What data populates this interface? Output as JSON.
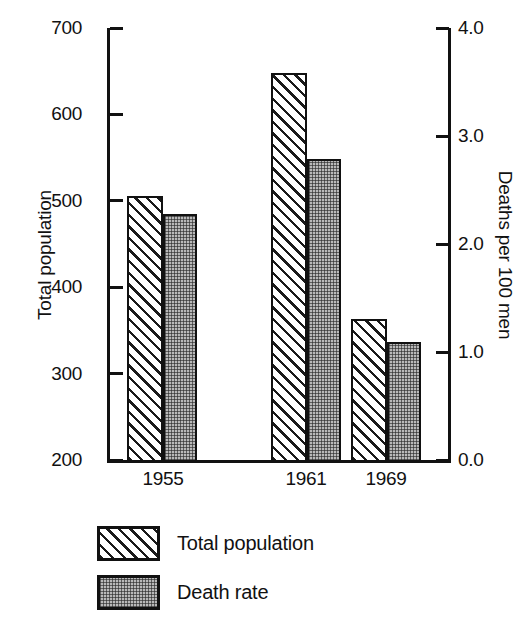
{
  "chart_data": {
    "type": "bar",
    "title": "",
    "categories": [
      "1955",
      "1961",
      "1969"
    ],
    "series": [
      {
        "name": "Total population",
        "axis": "left",
        "fill": "diagonal-hatch",
        "values": [
          505,
          648,
          363
        ]
      },
      {
        "name": "Death rate",
        "axis": "right",
        "fill": "grey-stipple",
        "values": [
          2.28,
          2.79,
          1.09
        ]
      }
    ],
    "xlabel": "",
    "ylabel": "Total population",
    "ylabel_right": "Deaths per 100 men",
    "ylim": [
      200,
      700
    ],
    "ylim_right": [
      0.0,
      4.0
    ],
    "yticks": [
      200,
      300,
      400,
      500,
      600,
      700
    ],
    "yticklabels": [
      "200",
      "300",
      "400",
      "500",
      "600",
      "700"
    ],
    "yticks_right": [
      0.0,
      1.0,
      2.0,
      3.0,
      4.0
    ],
    "yticklabels_right": [
      "0.0",
      "1.0",
      "2.0",
      "3.0",
      "4.0"
    ],
    "grid": false,
    "legend_position": "below-plot",
    "legend": [
      "Total population",
      "Death rate"
    ]
  },
  "colors": {
    "ink": "#111111",
    "page": "#ffffff",
    "stipple": "#b9b9b9"
  }
}
